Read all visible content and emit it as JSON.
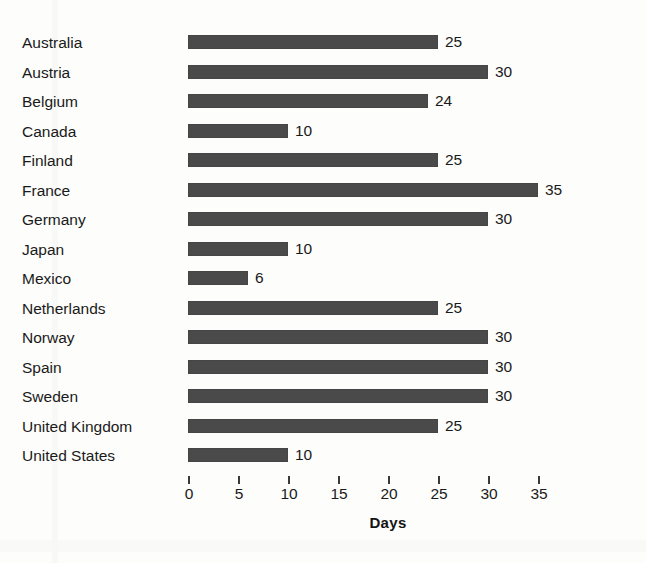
{
  "chart_data": {
    "type": "bar",
    "orientation": "horizontal",
    "title": "",
    "xlabel": "Days",
    "ylabel": "",
    "categories": [
      "Australia",
      "Austria",
      "Belgium",
      "Canada",
      "Finland",
      "France",
      "Germany",
      "Japan",
      "Mexico",
      "Netherlands",
      "Norway",
      "Spain",
      "Sweden",
      "United Kingdom",
      "United States"
    ],
    "values": [
      25,
      30,
      24,
      10,
      25,
      35,
      30,
      10,
      6,
      25,
      30,
      30,
      30,
      25,
      10
    ],
    "data_labels": [
      "25",
      "30",
      "24",
      "10",
      "25",
      "35",
      "30",
      "10",
      "6",
      "25",
      "30",
      "30",
      "30",
      "25",
      "10"
    ],
    "xlim": [
      0,
      35
    ],
    "xticks": [
      0,
      5,
      10,
      15,
      20,
      25,
      30,
      35
    ],
    "xtick_labels": [
      "0",
      "5",
      "10",
      "15",
      "20",
      "25",
      "30",
      "35"
    ],
    "grid": false,
    "legend": null,
    "bar_color": "#4a4a4a",
    "background_color": "#fdfdfb",
    "text_color": "#1a1a1a"
  },
  "axis": {
    "x_title": "Days"
  }
}
